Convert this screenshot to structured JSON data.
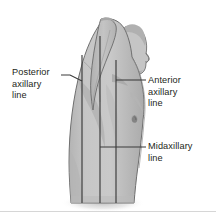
{
  "figure": {
    "background_color": "#ffffff",
    "body_fill_color": "#c2c2c2",
    "body_shadow_color": "#a9a9a9",
    "body_outline_color": "#6f6f6f",
    "line_color": "#3a3a3a",
    "text_color": "#231f20",
    "rule_color": "#d6d6d6"
  },
  "labels": {
    "posterior": {
      "line1": "Posterior",
      "line2": "axillary",
      "line3": "line",
      "full_text": "Posterior axillary line"
    },
    "anterior": {
      "line1": "Anterior",
      "line2": "axillary",
      "line3": "line",
      "full_text": "Anterior axillary line"
    },
    "midaxillary": {
      "line1": "Midaxillary",
      "line2": "line",
      "full_text": "Midaxillary line"
    }
  },
  "vertical_lines": [
    {
      "name": "posterior-axillary-line",
      "x": 82
    },
    {
      "name": "midaxillary-line",
      "x": 100
    },
    {
      "name": "anterior-axillary-line",
      "x": 116
    }
  ],
  "leader_lines": [
    {
      "name": "posterior-leader",
      "from_x": 62,
      "from_y": 76,
      "to_x": 82,
      "to_y": 80
    },
    {
      "name": "anterior-leader",
      "from_x": 116,
      "from_y": 80,
      "to_x": 146,
      "to_y": 80
    },
    {
      "name": "midaxillary-leader",
      "from_x": 100,
      "from_y": 147,
      "to_x": 146,
      "to_y": 147
    }
  ]
}
